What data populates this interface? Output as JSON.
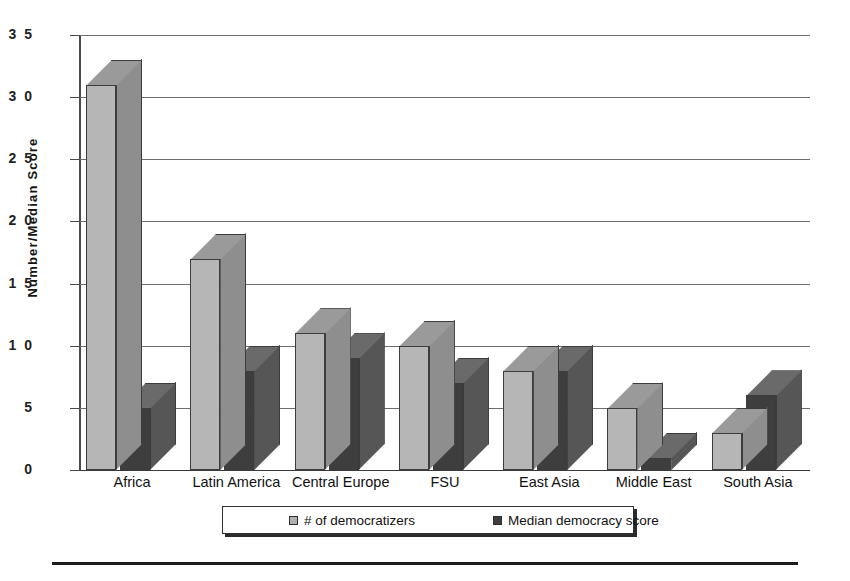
{
  "chart_data": {
    "type": "bar",
    "title": "",
    "subtitle": "",
    "xlabel": "",
    "ylabel": "Number/Median  Score",
    "ylim": [
      0,
      35
    ],
    "y_ticks": [
      0,
      5,
      10,
      15,
      20,
      25,
      30,
      35
    ],
    "grid": true,
    "legend_position": "bottom",
    "style": "3d-clustered-bar-grayscale",
    "categories": [
      "Africa",
      "Latin  America",
      "Central Europe",
      "FSU",
      "East Asia",
      "Middle East",
      "South Asia"
    ],
    "series": [
      {
        "name": "# of  democratizers",
        "color": "#b6b6b6",
        "values": [
          31,
          17,
          11,
          10,
          8,
          5,
          3
        ]
      },
      {
        "name": "Median democracy score",
        "color": "#3e3e3e",
        "values": [
          5,
          8,
          9,
          7,
          8,
          1,
          6
        ]
      }
    ],
    "annotations": []
  },
  "axis": {
    "y_tick_labels": [
      "0",
      "5",
      "1 0",
      "1 5",
      "2 0",
      "2 5",
      "3 0",
      "3 5"
    ],
    "y_title": "Number/Median  Score"
  },
  "legend": {
    "items": [
      {
        "label": "# of  democratizers",
        "swatch": "light-gray-swatch"
      },
      {
        "label": "Median democracy score",
        "swatch": "dark-gray-swatch"
      }
    ]
  },
  "colors": {
    "series_light_front": "#b6b6b6",
    "series_light_top": "#9a9a9a",
    "series_light_side": "#8e8e8e",
    "series_dark_front": "#3e3e3e",
    "series_dark_top": "#6a6a6a",
    "series_dark_side": "#565656",
    "gridline": "#6d6d6d",
    "axis": "#4a4a4a",
    "text": "#111111"
  }
}
